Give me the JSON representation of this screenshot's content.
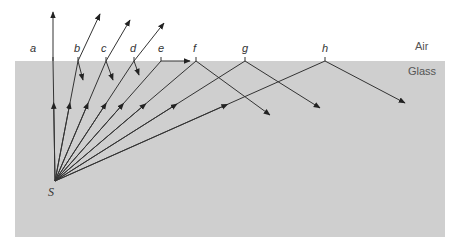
{
  "diagram": {
    "regions": {
      "air_label": "Air",
      "glass_label": "Glass",
      "glass_color": "#cfcfcf",
      "air_color": "#ffffff"
    },
    "source": {
      "label": "S",
      "x": 55,
      "y": 181
    },
    "surface_y": 61,
    "ray_color": "#333333",
    "rays": [
      {
        "label": "a",
        "hit_x": 53,
        "type": "refracted",
        "out": [
          53,
          12
        ]
      },
      {
        "label": "b",
        "hit_x": 78,
        "type": "refracted+partial-reflection",
        "out": [
          100,
          14
        ],
        "refl": [
          83,
          80
        ]
      },
      {
        "label": "c",
        "hit_x": 106,
        "type": "refracted+partial-reflection",
        "out": [
          130,
          20
        ],
        "refl": [
          113,
          80
        ]
      },
      {
        "label": "d",
        "hit_x": 134,
        "type": "refracted+partial-reflection",
        "out": [
          164,
          23
        ],
        "refl": [
          139,
          75
        ]
      },
      {
        "label": "e",
        "hit_x": 161,
        "type": "critical-angle",
        "out": [
          190,
          61
        ]
      },
      {
        "label": "f",
        "hit_x": 196,
        "type": "total-internal-reflection",
        "refl": [
          270,
          115
        ]
      },
      {
        "label": "g",
        "hit_x": 245,
        "type": "total-internal-reflection",
        "refl": [
          320,
          108
        ]
      },
      {
        "label": "h",
        "hit_x": 325,
        "type": "total-internal-reflection",
        "refl": [
          405,
          103
        ]
      }
    ]
  }
}
